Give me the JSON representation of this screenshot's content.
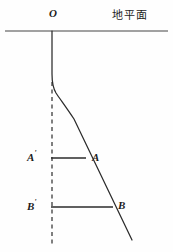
{
  "figure": {
    "title_label": "",
    "background_color": "#fefefe",
    "stroke_color": "#1c1c1c",
    "labels": {
      "origin": "O",
      "ground_plane": "地平面",
      "a_prime": "A",
      "a_prime_mark": "'",
      "point_a": "A",
      "b_prime": "B",
      "b_prime_mark": "'",
      "point_b": "B"
    },
    "elements": {
      "ground_line_name": "ground-plane-line",
      "vertical_dashed_name": "vertical-dashed-reference-line",
      "trajectory_name": "falling-body-trajectory-curve",
      "segment_a_name": "horizontal-segment-a",
      "segment_b_name": "horizontal-segment-b"
    },
    "geometry": {
      "ground_line": {
        "x1": 5,
        "y1": 31,
        "x2": 168,
        "y2": 31
      },
      "dashed_line": {
        "x": 52,
        "y1": 82,
        "y2": 246
      },
      "trajectory_path": "M 52,31 L 52,74 C 52,84 53,88 56,93 C 60,99 66,107 74,119 L 132,240",
      "segment_a": {
        "x1": 51,
        "y1": 158,
        "x2": 86,
        "y2": 158
      },
      "segment_b": {
        "x1": 51,
        "y1": 207,
        "x2": 113,
        "y2": 207
      }
    }
  }
}
